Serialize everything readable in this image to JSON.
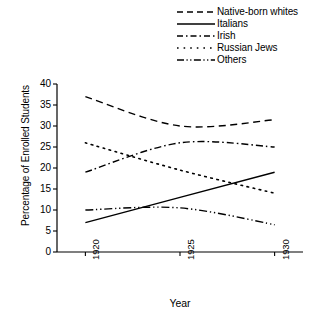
{
  "chart_data": {
    "type": "line",
    "title": "",
    "xlabel": "Year",
    "ylabel": "Percentage of Enrolled Students",
    "x": [
      1920,
      1925,
      1930
    ],
    "xticks": [
      "1920",
      "1925",
      "1930"
    ],
    "xlim": [
      1918.5,
      1931.5
    ],
    "ylim": [
      0,
      40
    ],
    "yticks": [
      "0",
      "5",
      "10",
      "15",
      "20",
      "25",
      "30",
      "35",
      "40"
    ],
    "grid": false,
    "legend_position": "top-right",
    "series": [
      {
        "name": "Native-born whites",
        "style": "dashed",
        "values": [
          37.0,
          30.0,
          31.5
        ]
      },
      {
        "name": "Italians",
        "style": "solid",
        "values": [
          7.0,
          13.0,
          19.0
        ]
      },
      {
        "name": "Irish",
        "style": "dash-dot",
        "values": [
          19.0,
          26.0,
          25.0
        ]
      },
      {
        "name": "Russian Jews",
        "style": "dotted",
        "values": [
          26.0,
          19.5,
          14.0
        ]
      },
      {
        "name": "Others",
        "style": "dash-dot-dot",
        "values": [
          10.0,
          10.5,
          6.5
        ]
      }
    ]
  },
  "legend": {
    "items": [
      {
        "label": "Native-born whites",
        "swatch": "dashed-line-swatch"
      },
      {
        "label": "Italians",
        "swatch": "solid-line-swatch"
      },
      {
        "label": "Irish",
        "swatch": "dash-dot-line-swatch"
      },
      {
        "label": "Russian Jews",
        "swatch": "dotted-line-swatch"
      },
      {
        "label": "Others",
        "swatch": "dash-dot-dot-line-swatch"
      }
    ]
  },
  "axes": {
    "y_label": "Percentage of Enrolled Students",
    "x_label": "Year",
    "y_ticks": [
      "40",
      "35",
      "30",
      "25",
      "20",
      "15",
      "10",
      "5",
      "0"
    ],
    "x_ticks": [
      "1920",
      "1925",
      "1930"
    ]
  },
  "colors": {
    "line": "#000000",
    "axis": "#000000",
    "background": "#ffffff"
  }
}
